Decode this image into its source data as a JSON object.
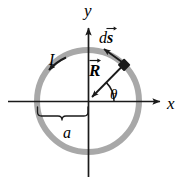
{
  "figure": {
    "background_color": "#ffffff",
    "ring_color": "#a8a8a8",
    "axis_color": "#1a1a1a",
    "element_color": "#1a1a1a",
    "width": 186,
    "height": 180
  },
  "axes": {
    "x_label": "x",
    "y_label": "y",
    "origin": {
      "x": 88,
      "y": 101
    },
    "x_axis_from": {
      "x": 8,
      "y": 101
    },
    "x_axis_to": {
      "x": 166,
      "y": 101
    },
    "y_axis_from": {
      "x": 88,
      "y": 176
    },
    "y_axis_to": {
      "x": 88,
      "y": 22
    }
  },
  "ring": {
    "center": {
      "x": 88,
      "y": 101
    },
    "radius": 51,
    "stroke_width": 6,
    "color": "#a8a8a8",
    "radius_label": "a"
  },
  "labels": {
    "current": "I",
    "radius": "a",
    "angle": "θ",
    "displacement_d": "d",
    "displacement_s": "s",
    "position_R": "R",
    "x_axis": "x",
    "y_axis": "y"
  },
  "annotations": {
    "current_arrow": {
      "name": "current-direction-arrow",
      "description": "counterclockwise tangent arrow on ring in upper-left quadrant",
      "angle_deg": 140
    },
    "ds_arrow": {
      "name": "ds-tangent-arrow",
      "description": "tangent vector arrow at the differential element pointing counterclockwise",
      "angle_deg": 45
    },
    "R_arrow": {
      "name": "position-vector-arrow",
      "description": "vector from element toward origin, arrowhead at origin end",
      "angle_deg": 45
    },
    "theta_arc": {
      "name": "theta-angle-arc",
      "description": "arc from x-axis to R vector",
      "start_deg": 0,
      "end_deg": 45,
      "arc_radius": 26
    },
    "element": {
      "name": "differential-element",
      "description": "small filled black segment on the ring",
      "angle_deg": 45
    },
    "radius_brace": {
      "name": "radius-brace",
      "description": "curly brace under x-axis spanning from ring left edge to origin",
      "from_x": 37,
      "to_x": 88,
      "y": 108
    }
  }
}
